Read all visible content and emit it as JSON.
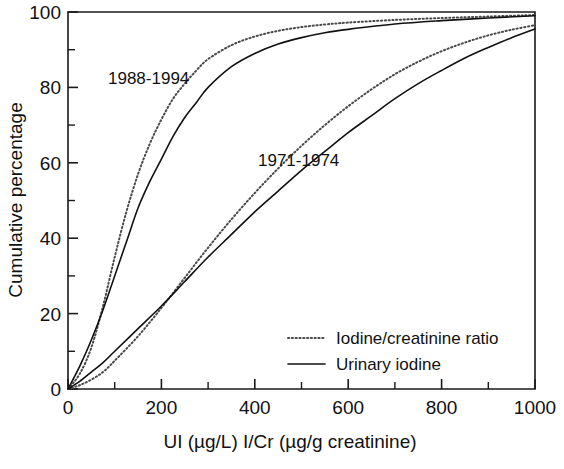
{
  "chart_data": {
    "type": "line",
    "title": "",
    "xlabel": "UI (µg/L)   I/Cr (µg/g creatinine)",
    "ylabel": "Cumulative percentage",
    "xlim": [
      0,
      1000
    ],
    "ylim": [
      0,
      100
    ],
    "xticks": [
      0,
      100,
      200,
      300,
      400,
      500,
      600,
      700,
      800,
      900,
      1000
    ],
    "xtick_labels": [
      "0",
      "",
      "200",
      "",
      "400",
      "",
      "600",
      "",
      "800",
      "",
      "1000"
    ],
    "yticks": [
      0,
      10,
      20,
      30,
      40,
      50,
      60,
      70,
      80,
      90,
      100
    ],
    "ytick_labels": [
      "0",
      "",
      "20",
      "",
      "40",
      "",
      "60",
      "",
      "80",
      "",
      "100"
    ],
    "grid": false,
    "legend_position": "lower-right",
    "legend": [
      {
        "label": "Iodine/creatinine ratio",
        "style": "dotted"
      },
      {
        "label": "Urinary iodine",
        "style": "solid"
      }
    ],
    "annotations": [
      {
        "text": "1988-1994",
        "x": 190,
        "y": 85
      },
      {
        "text": "1971-1974",
        "x": 560,
        "y": 62
      }
    ],
    "series": [
      {
        "name": "1988-1994 Urinary iodine",
        "style": "solid",
        "group": "1988-1994",
        "x": [
          0,
          25,
          50,
          75,
          100,
          125,
          150,
          175,
          200,
          225,
          250,
          275,
          300,
          350,
          400,
          450,
          500,
          550,
          600,
          700,
          800,
          900,
          1000
        ],
        "y": [
          0,
          6,
          13,
          21,
          30,
          39,
          48,
          55,
          61,
          67,
          72,
          76,
          80,
          85.5,
          89,
          91.5,
          93.2,
          94.5,
          95.4,
          96.8,
          97.7,
          98.4,
          99
        ]
      },
      {
        "name": "1988-1994 Iodine/creatinine ratio",
        "style": "dotted",
        "group": "1988-1994",
        "x": [
          0,
          25,
          50,
          75,
          100,
          125,
          150,
          175,
          200,
          225,
          250,
          275,
          300,
          350,
          400,
          450,
          500,
          550,
          600,
          700,
          800,
          900,
          1000
        ],
        "y": [
          0,
          4,
          11,
          22,
          35,
          47,
          57,
          65,
          71.5,
          77,
          81,
          84.5,
          87.5,
          91.2,
          93.5,
          95,
          96,
          96.7,
          97.2,
          97.9,
          98.4,
          98.8,
          99.2
        ]
      },
      {
        "name": "1971-1974 Urinary iodine",
        "style": "solid",
        "group": "1971-1974",
        "x": [
          0,
          25,
          50,
          75,
          100,
          150,
          200,
          250,
          300,
          350,
          400,
          450,
          500,
          550,
          600,
          650,
          700,
          750,
          800,
          850,
          900,
          950,
          1000
        ],
        "y": [
          0,
          2,
          4.5,
          7,
          10,
          16,
          22,
          28.5,
          35,
          41,
          47,
          52.5,
          58,
          63,
          68,
          72.5,
          77,
          81,
          84.5,
          87.8,
          90.6,
          93.2,
          95.5
        ]
      },
      {
        "name": "1971-1974 Iodine/creatinine ratio",
        "style": "dotted",
        "group": "1971-1974",
        "x": [
          0,
          25,
          50,
          75,
          100,
          150,
          200,
          250,
          300,
          350,
          400,
          450,
          500,
          550,
          600,
          650,
          700,
          750,
          800,
          850,
          900,
          950,
          1000
        ],
        "y": [
          0,
          1,
          2.5,
          4.5,
          7.5,
          14,
          21.5,
          29.5,
          37.5,
          45,
          52,
          58.5,
          64.5,
          70,
          75,
          79.5,
          83.5,
          86.8,
          89.6,
          91.9,
          93.8,
          95.3,
          96.5
        ]
      }
    ]
  },
  "axes": {
    "y_title": "Cumulative percentage",
    "x_title": "UI (µg/L)   I/Cr (µg/g creatinine)"
  },
  "legend": {
    "entry_dotted": "Iodine/creatinine ratio",
    "entry_solid": "Urinary iodine"
  },
  "annotations": {
    "group_recent": "1988-1994",
    "group_early": "1971-1974"
  },
  "colors": {
    "axis": "#1a1a1a",
    "solid_curve": "#111111",
    "dotted_curve": "#4a4a4a",
    "background": "#ffffff"
  }
}
